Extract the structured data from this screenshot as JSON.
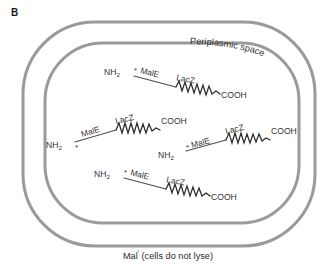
{
  "figure": {
    "panel_label": "B",
    "periplasm_label": "Periplasmic space",
    "bottom_caption_main": "Mal",
    "bottom_caption_sup": "′",
    "bottom_caption_rest": " (cells do not lyse)",
    "colors": {
      "membrane": "#9a9a9a",
      "protein_line": "#4d4d4d",
      "protein_zigzag": "#2b2b2b",
      "text": "#333333",
      "background": "#ffffff"
    }
  },
  "proteins": [
    {
      "id": "fusion-protein-1",
      "n_terminus": "NH",
      "n_terminus_sub": "2",
      "star": "*",
      "domain_n": "MalE",
      "domain_c": "LacZ",
      "c_terminus": "COOH"
    },
    {
      "id": "fusion-protein-2",
      "n_terminus": "NH",
      "n_terminus_sub": "2",
      "star": "*",
      "domain_n": "MalE",
      "domain_c": "LacZ",
      "c_terminus": "COOH"
    },
    {
      "id": "fusion-protein-3",
      "n_terminus": "NH",
      "n_terminus_sub": "2",
      "star": "*",
      "domain_n": "MalE",
      "domain_c": "LacZ",
      "c_terminus": "COOH"
    },
    {
      "id": "fusion-protein-4",
      "n_terminus": "NH",
      "n_terminus_sub": "2",
      "star": "*",
      "domain_n": "MalE",
      "domain_c": "LacZ",
      "c_terminus": "COOH"
    }
  ]
}
